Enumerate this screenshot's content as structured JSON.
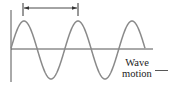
{
  "diagram": {
    "labels": {
      "wave_motion_line1": "Wave",
      "wave_motion_line2": "motion"
    },
    "colors": {
      "wave": "#8a8a8a",
      "axis": "#555555",
      "arrow": "#333333",
      "text": "#222222"
    },
    "wave": {
      "start_x": 11,
      "end_x": 145,
      "center_y": 50,
      "amplitude": 29,
      "wavelength": 54,
      "phase_x": 10.5
    },
    "wavelength_arrow": {
      "x1": 23,
      "x2": 78,
      "y": 8
    }
  }
}
